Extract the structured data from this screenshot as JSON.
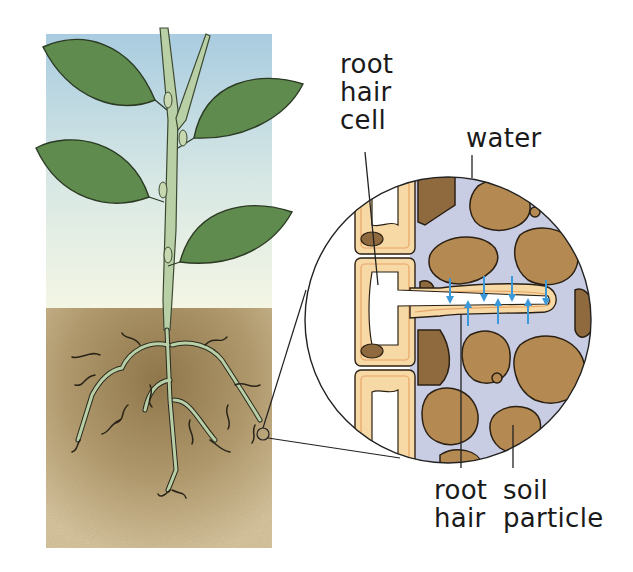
{
  "diagram": {
    "colors": {
      "sky_top": "#a9cce0",
      "sky_bottom": "#f3f6e6",
      "soil_light": "#cbb58e",
      "soil_dark": "#8e7446",
      "leaf": "#5f8b4e",
      "leaf_outline": "#2c3a24",
      "stem": "#b9cfa6",
      "water": "#c9cde3",
      "soil_particle": "#b48a52",
      "soil_particle_dark": "#8f6a3e",
      "cell_wall": "#f7d9a6",
      "cell_membrane": "#e8a466",
      "arrow": "#3a9ad9",
      "line": "#222222"
    },
    "labels": {
      "root_hair_cell": [
        "root",
        "hair",
        "cell"
      ],
      "water": [
        "water"
      ],
      "root_hair": [
        "root",
        "hair"
      ],
      "soil_particle": [
        "soil",
        "particle"
      ]
    },
    "panels": {
      "plant": "Plant with leaves above ground and branching roots in soil",
      "magnified": "Magnified view of root hair cell extending between soil particles with water arrows"
    },
    "arrows": {
      "down_count": 4,
      "up_count": 3,
      "meaning": "water moving into root hair"
    }
  }
}
